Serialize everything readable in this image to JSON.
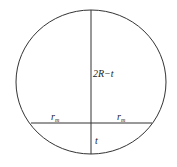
{
  "diagram": {
    "labels": {
      "upper_segment": "2R−t",
      "left_half_chord": "r",
      "left_half_chord_sub": "m",
      "right_half_chord": "r",
      "right_half_chord_sub": "m",
      "lower_segment": "t"
    },
    "colors": {
      "stroke": "#333333",
      "text": "#222222"
    }
  }
}
